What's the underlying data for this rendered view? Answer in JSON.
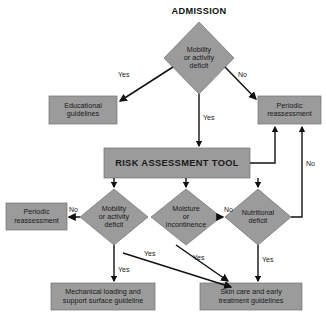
{
  "diagram": {
    "title": "ADMISSION",
    "type": "flowchart",
    "colors": {
      "background": "#ffffff",
      "node_fill": "#9b9b9b",
      "node_fill_light": "#a8a8a8",
      "node_stroke": "#6f6f6f",
      "line": "#111111",
      "text": "#1a1a1a"
    },
    "nodes": [
      {
        "id": "admission",
        "shape": "title",
        "label": "ADMISSION"
      },
      {
        "id": "mobility-deficit-top",
        "shape": "diamond",
        "label": "Mobility\nor activity\ndeficit"
      },
      {
        "id": "educational-guidelines",
        "shape": "box",
        "label": "Educational\nguidelines"
      },
      {
        "id": "periodic-reassessment-top",
        "shape": "box",
        "label": "Periodic\nreassessment"
      },
      {
        "id": "risk-assessment-tool",
        "shape": "box",
        "label": "RISK ASSESSMENT TOOL"
      },
      {
        "id": "periodic-reassessment-left",
        "shape": "box",
        "label": "Periodic\nreassessment"
      },
      {
        "id": "mobility-deficit-bottom",
        "shape": "diamond",
        "label": "Mobility\nor activity\ndeficit"
      },
      {
        "id": "moisture-incontinence",
        "shape": "diamond",
        "label": "Moisture\nor\nincontinence"
      },
      {
        "id": "nutritional-deficit",
        "shape": "diamond",
        "label": "Nutritional\ndeficit"
      },
      {
        "id": "mechanical-loading",
        "shape": "box",
        "label": "Mechanical loading and\nsupport surface guideline"
      },
      {
        "id": "skin-care",
        "shape": "box",
        "label": "Skin care and early\ntreatment guidelines"
      }
    ],
    "edges": [
      {
        "id": "e1",
        "from": "mobility-deficit-top",
        "to": "educational-guidelines",
        "label": "Yes"
      },
      {
        "id": "e2",
        "from": "mobility-deficit-top",
        "to": "periodic-reassessment-top",
        "label": "No"
      },
      {
        "id": "e3",
        "from": "mobility-deficit-top",
        "to": "risk-assessment-tool",
        "label": "Yes"
      },
      {
        "id": "e4",
        "from": "risk-assessment-tool",
        "to": "mobility-deficit-bottom",
        "label": ""
      },
      {
        "id": "e5",
        "from": "risk-assessment-tool",
        "to": "moisture-incontinence",
        "label": ""
      },
      {
        "id": "e6",
        "from": "risk-assessment-tool",
        "to": "nutritional-deficit",
        "label": ""
      },
      {
        "id": "e7",
        "from": "risk-assessment-tool",
        "to": "periodic-reassessment-top",
        "label": ""
      },
      {
        "id": "e8",
        "from": "mobility-deficit-bottom",
        "to": "periodic-reassessment-left",
        "label": "No"
      },
      {
        "id": "e9",
        "from": "mobility-deficit-bottom",
        "to": "mechanical-loading",
        "label": "Yes"
      },
      {
        "id": "e10",
        "from": "mobility-deficit-bottom",
        "to": "skin-care",
        "label": "Yes"
      },
      {
        "id": "e11",
        "from": "moisture-incontinence",
        "to": "nutritional-deficit",
        "label": "No"
      },
      {
        "id": "e12",
        "from": "moisture-incontinence",
        "to": "skin-care",
        "label": "Yes"
      },
      {
        "id": "e13",
        "from": "nutritional-deficit",
        "to": "skin-care",
        "label": "Yes"
      },
      {
        "id": "e14",
        "from": "nutritional-deficit",
        "to": "periodic-reassessment-top",
        "label": "No"
      }
    ],
    "edge_labels": {
      "yes_top_left": "Yes",
      "no_top_right": "No",
      "yes_top_center": "Yes",
      "no_mobility_left": "No",
      "no_moisture_right": "No",
      "no_nutrition_loop": "No",
      "yes_mobility_down": "Yes",
      "yes_mobility_diag": "Yes",
      "yes_moisture_diag": "Yes",
      "yes_nutrition_down": "Yes"
    }
  }
}
